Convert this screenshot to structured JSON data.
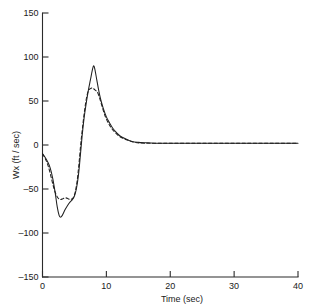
{
  "chart_data": {
    "type": "line",
    "title": "",
    "xlabel": "Time (sec)",
    "ylabel": "Wx (ft / sec)",
    "xlim": [
      0,
      40
    ],
    "ylim": [
      -150,
      150
    ],
    "xticks": [
      0,
      10,
      20,
      30,
      40
    ],
    "yticks": [
      -150,
      -100,
      -50,
      0,
      50,
      100,
      150
    ],
    "xtick_labels": [
      "0",
      "10",
      "20",
      "30",
      "40"
    ],
    "ytick_labels": [
      "-150",
      "-100",
      "-50",
      "0",
      "50",
      "100",
      "150"
    ],
    "grid": false,
    "legend": null,
    "series": [
      {
        "name": "solid",
        "style": "solid",
        "color": "#1f1f1f",
        "x": [
          0.0,
          0.4,
          0.8,
          1.2,
          1.6,
          2.0,
          2.3,
          2.6,
          2.8,
          3.1,
          3.5,
          3.9,
          4.3,
          4.7,
          5.0,
          5.3,
          5.6,
          5.9,
          6.2,
          6.5,
          6.9,
          7.2,
          7.5,
          7.8,
          8.0,
          8.2,
          8.5,
          8.8,
          9.1,
          9.5,
          10.0,
          10.5,
          11.0,
          11.6,
          12.2,
          13.0,
          14.0,
          15.0,
          16.5,
          18.0,
          20.0,
          24.0,
          28.0,
          32.0,
          36.0,
          40.0
        ],
        "y": [
          -10,
          -14,
          -19,
          -26,
          -38,
          -55,
          -70,
          -80,
          -82,
          -80,
          -74,
          -69,
          -65,
          -62,
          -58,
          -50,
          -36,
          -14,
          10,
          30,
          50,
          63,
          74,
          85,
          90,
          86,
          74,
          62,
          52,
          42,
          32,
          25,
          19,
          14,
          10,
          7,
          4,
          3,
          2.5,
          2,
          2,
          2,
          2,
          2,
          2,
          2
        ]
      },
      {
        "name": "dashed",
        "style": "dashed",
        "color": "#1f1f1f",
        "x": [
          0.0,
          0.4,
          0.8,
          1.2,
          1.6,
          2.0,
          2.4,
          2.8,
          3.2,
          3.6,
          4.0,
          4.4,
          4.8,
          5.1,
          5.4,
          5.7,
          6.0,
          6.3,
          6.6,
          6.9,
          7.2,
          7.5,
          7.8,
          8.0,
          8.3,
          8.6,
          9.0,
          9.4,
          9.8,
          10.3,
          10.8,
          11.4,
          12.0,
          12.8,
          13.6,
          14.5,
          16.0,
          18.0,
          20.0,
          24.0,
          28.0,
          32.0,
          36.0,
          40.0
        ],
        "y": [
          -10,
          -15,
          -22,
          -32,
          -44,
          -54,
          -60,
          -62,
          -61,
          -60,
          -61,
          -62,
          -60,
          -54,
          -42,
          -22,
          2,
          22,
          40,
          54,
          62,
          64,
          65,
          64,
          62,
          60,
          52,
          42,
          33,
          25,
          19,
          14,
          10,
          7,
          5,
          3,
          2,
          2,
          2,
          2,
          2,
          2,
          2,
          2
        ]
      }
    ]
  },
  "axes": {
    "x_axis_name": "time-axis",
    "y_axis_name": "wx-axis"
  }
}
